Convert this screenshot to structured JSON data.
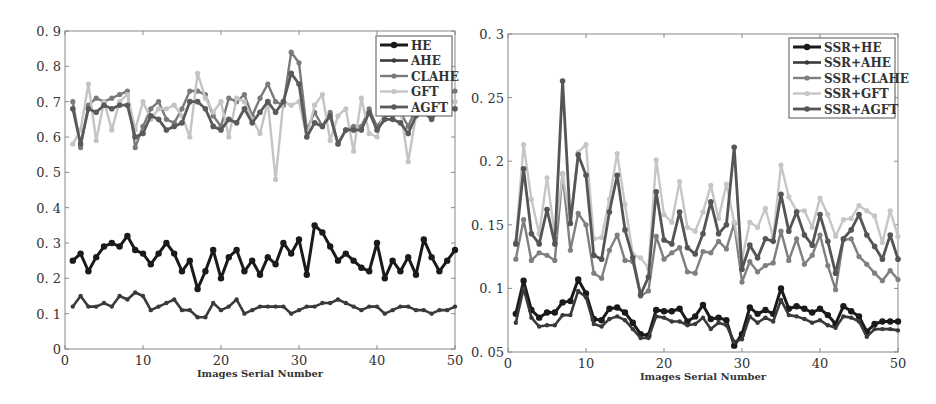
{
  "chart_data": [
    {
      "type": "line",
      "title": "",
      "xlabel": "Images Serial Number",
      "ylabel": "",
      "xlim": [
        0,
        50
      ],
      "ylim": [
        0,
        0.9
      ],
      "xticks": [
        "0",
        "10",
        "20",
        "30",
        "40",
        "50"
      ],
      "yticks": [
        "0",
        "0.1",
        "0.2",
        "0.3",
        "0.4",
        "0.5",
        "0.6",
        "0.7",
        "0.8",
        "0.9"
      ],
      "grid": false,
      "legend_position": "upper right",
      "x": [
        1,
        2,
        3,
        4,
        5,
        6,
        7,
        8,
        9,
        10,
        11,
        12,
        13,
        14,
        15,
        16,
        17,
        18,
        19,
        20,
        21,
        22,
        23,
        24,
        25,
        26,
        27,
        28,
        29,
        30,
        31,
        32,
        33,
        34,
        35,
        36,
        37,
        38,
        39,
        40,
        41,
        42,
        43,
        44,
        45,
        46,
        47,
        48,
        49,
        50
      ],
      "series": [
        {
          "name": "HE",
          "color": "#1a1a1a",
          "values": [
            0.25,
            0.27,
            0.22,
            0.26,
            0.29,
            0.3,
            0.29,
            0.32,
            0.28,
            0.27,
            0.24,
            0.27,
            0.3,
            0.27,
            0.22,
            0.25,
            0.17,
            0.22,
            0.28,
            0.2,
            0.26,
            0.28,
            0.22,
            0.25,
            0.21,
            0.26,
            0.24,
            0.3,
            0.27,
            0.31,
            0.21,
            0.35,
            0.33,
            0.29,
            0.25,
            0.27,
            0.25,
            0.23,
            0.22,
            0.3,
            0.2,
            0.25,
            0.22,
            0.26,
            0.21,
            0.31,
            0.26,
            0.22,
            0.25,
            0.28
          ]
        },
        {
          "name": "AHE",
          "color": "#3a3a3a",
          "values": [
            0.12,
            0.15,
            0.12,
            0.12,
            0.13,
            0.12,
            0.15,
            0.14,
            0.16,
            0.15,
            0.11,
            0.12,
            0.13,
            0.14,
            0.11,
            0.11,
            0.09,
            0.09,
            0.13,
            0.11,
            0.12,
            0.14,
            0.1,
            0.11,
            0.12,
            0.12,
            0.12,
            0.12,
            0.1,
            0.11,
            0.12,
            0.12,
            0.13,
            0.13,
            0.14,
            0.13,
            0.12,
            0.11,
            0.12,
            0.12,
            0.1,
            0.11,
            0.12,
            0.12,
            0.11,
            0.11,
            0.1,
            0.11,
            0.11,
            0.12
          ]
        },
        {
          "name": "CLAHE",
          "color": "#7a7a7a",
          "values": [
            0.7,
            0.57,
            0.69,
            0.71,
            0.7,
            0.71,
            0.72,
            0.73,
            0.57,
            0.63,
            0.68,
            0.7,
            0.65,
            0.64,
            0.68,
            0.73,
            0.73,
            0.72,
            0.66,
            0.63,
            0.71,
            0.7,
            0.72,
            0.66,
            0.71,
            0.75,
            0.7,
            0.69,
            0.84,
            0.81,
            0.62,
            0.67,
            0.63,
            0.67,
            0.58,
            0.62,
            0.63,
            0.63,
            0.68,
            0.63,
            0.66,
            0.66,
            0.67,
            0.63,
            0.68,
            0.7,
            0.66,
            0.72,
            0.72,
            0.73
          ]
        },
        {
          "name": "GFT",
          "color": "#c4c4c4",
          "values": [
            0.58,
            0.62,
            0.75,
            0.59,
            0.7,
            0.62,
            0.7,
            0.72,
            0.62,
            0.7,
            0.65,
            0.68,
            0.68,
            0.69,
            0.66,
            0.6,
            0.78,
            0.71,
            0.67,
            0.7,
            0.6,
            0.71,
            0.7,
            0.65,
            0.61,
            0.7,
            0.48,
            0.7,
            0.69,
            0.7,
            0.6,
            0.69,
            0.72,
            0.59,
            0.66,
            0.68,
            0.56,
            0.71,
            0.61,
            0.6,
            0.68,
            0.69,
            0.68,
            0.53,
            0.66,
            0.7,
            0.7,
            0.7,
            0.7,
            0.7
          ]
        },
        {
          "name": "AGFT",
          "color": "#5a5a5a",
          "values": [
            0.68,
            0.58,
            0.68,
            0.67,
            0.69,
            0.68,
            0.69,
            0.69,
            0.6,
            0.61,
            0.66,
            0.65,
            0.62,
            0.63,
            0.64,
            0.7,
            0.7,
            0.68,
            0.63,
            0.62,
            0.65,
            0.64,
            0.68,
            0.64,
            0.67,
            0.7,
            0.67,
            0.7,
            0.78,
            0.75,
            0.6,
            0.64,
            0.63,
            0.66,
            0.58,
            0.62,
            0.62,
            0.62,
            0.67,
            0.62,
            0.65,
            0.65,
            0.64,
            0.61,
            0.66,
            0.67,
            0.65,
            0.68,
            0.68,
            0.68
          ]
        }
      ]
    },
    {
      "type": "line",
      "title": "",
      "xlabel": "Images Serial Number",
      "ylabel": "",
      "xlim": [
        0,
        50
      ],
      "ylim": [
        0.05,
        0.3
      ],
      "xticks": [
        "0",
        "10",
        "20",
        "30",
        "40",
        "50"
      ],
      "yticks": [
        "0.05",
        "0.1",
        "0.15",
        "0.2",
        "0.25",
        "0.3"
      ],
      "grid": false,
      "legend_position": "upper right",
      "x": [
        1,
        2,
        3,
        4,
        5,
        6,
        7,
        8,
        9,
        10,
        11,
        12,
        13,
        14,
        15,
        16,
        17,
        18,
        19,
        20,
        21,
        22,
        23,
        24,
        25,
        26,
        27,
        28,
        29,
        30,
        31,
        32,
        33,
        34,
        35,
        36,
        37,
        38,
        39,
        40,
        41,
        42,
        43,
        44,
        45,
        46,
        47,
        48,
        49,
        50
      ],
      "series": [
        {
          "name": "SSR+HE",
          "color": "#1a1a1a",
          "values": [
            0.08,
            0.106,
            0.083,
            0.077,
            0.081,
            0.081,
            0.089,
            0.09,
            0.107,
            0.096,
            0.076,
            0.075,
            0.084,
            0.085,
            0.081,
            0.073,
            0.064,
            0.063,
            0.083,
            0.082,
            0.082,
            0.084,
            0.074,
            0.078,
            0.087,
            0.076,
            0.077,
            0.075,
            0.055,
            0.064,
            0.085,
            0.08,
            0.083,
            0.08,
            0.1,
            0.084,
            0.086,
            0.084,
            0.081,
            0.084,
            0.079,
            0.072,
            0.086,
            0.082,
            0.078,
            0.066,
            0.072,
            0.074,
            0.074,
            0.074
          ]
        },
        {
          "name": "SSR+AHE",
          "color": "#3a3a3a",
          "values": [
            0.073,
            0.1,
            0.077,
            0.07,
            0.071,
            0.071,
            0.079,
            0.079,
            0.098,
            0.093,
            0.072,
            0.07,
            0.076,
            0.078,
            0.075,
            0.068,
            0.061,
            0.061,
            0.078,
            0.077,
            0.074,
            0.074,
            0.071,
            0.072,
            0.077,
            0.068,
            0.073,
            0.071,
            0.058,
            0.06,
            0.078,
            0.073,
            0.077,
            0.074,
            0.091,
            0.079,
            0.078,
            0.076,
            0.073,
            0.075,
            0.071,
            0.069,
            0.078,
            0.077,
            0.074,
            0.062,
            0.068,
            0.068,
            0.068,
            0.067
          ]
        },
        {
          "name": "SSR+CLAHE",
          "color": "#7f7f7f",
          "values": [
            0.123,
            0.154,
            0.122,
            0.128,
            0.126,
            0.122,
            0.19,
            0.13,
            0.159,
            0.15,
            0.112,
            0.108,
            0.13,
            0.142,
            0.122,
            0.121,
            0.094,
            0.098,
            0.141,
            0.123,
            0.128,
            0.132,
            0.113,
            0.112,
            0.129,
            0.128,
            0.137,
            0.131,
            0.151,
            0.105,
            0.121,
            0.113,
            0.118,
            0.12,
            0.145,
            0.122,
            0.139,
            0.119,
            0.126,
            0.142,
            0.118,
            0.099,
            0.138,
            0.139,
            0.125,
            0.119,
            0.112,
            0.106,
            0.114,
            0.107
          ]
        },
        {
          "name": "SSR+GFT",
          "color": "#c6c6c6",
          "values": [
            0.137,
            0.213,
            0.17,
            0.143,
            0.187,
            0.142,
            0.19,
            0.152,
            0.207,
            0.213,
            0.139,
            0.14,
            0.17,
            0.206,
            0.166,
            0.127,
            0.124,
            0.116,
            0.201,
            0.158,
            0.152,
            0.184,
            0.148,
            0.145,
            0.16,
            0.181,
            0.155,
            0.182,
            0.152,
            0.123,
            0.152,
            0.148,
            0.163,
            0.14,
            0.197,
            0.172,
            0.161,
            0.161,
            0.148,
            0.171,
            0.158,
            0.141,
            0.154,
            0.155,
            0.165,
            0.161,
            0.157,
            0.136,
            0.161,
            0.141
          ]
        },
        {
          "name": "SSR+AGFT",
          "color": "#555555",
          "values": [
            0.135,
            0.194,
            0.143,
            0.135,
            0.162,
            0.135,
            0.263,
            0.151,
            0.205,
            0.189,
            0.126,
            0.123,
            0.16,
            0.189,
            0.146,
            0.124,
            0.095,
            0.109,
            0.176,
            0.138,
            0.135,
            0.16,
            0.132,
            0.127,
            0.143,
            0.168,
            0.143,
            0.15,
            0.211,
            0.115,
            0.134,
            0.124,
            0.139,
            0.137,
            0.174,
            0.145,
            0.16,
            0.142,
            0.134,
            0.158,
            0.137,
            0.112,
            0.139,
            0.146,
            0.158,
            0.142,
            0.133,
            0.123,
            0.142,
            0.123
          ]
        }
      ]
    }
  ]
}
